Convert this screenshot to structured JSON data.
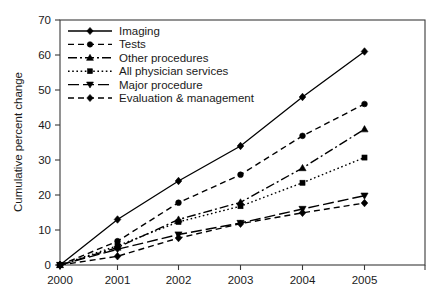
{
  "chart_data": {
    "type": "line",
    "title": "",
    "xlabel": "",
    "ylabel": "Cumulative percent change",
    "categories": [
      "2000",
      "2001",
      "2002",
      "2003",
      "2004",
      "2005"
    ],
    "x": [
      2000,
      2001,
      2002,
      2003,
      2004,
      2005
    ],
    "xlim": [
      2000,
      2005
    ],
    "ylim": [
      0,
      70
    ],
    "yticks": [
      0,
      10,
      20,
      30,
      40,
      50,
      60,
      70
    ],
    "xticks": [
      "2000",
      "2001",
      "2002",
      "2003",
      "2004",
      "2005"
    ],
    "grid": false,
    "legend_position": "top-left",
    "series": [
      {
        "name": "Imaging",
        "values": [
          0,
          13.0,
          24.0,
          34.0,
          48.0,
          61.0
        ],
        "marker": "diamond",
        "line_style": "solid",
        "color": "#000000"
      },
      {
        "name": "Tests",
        "values": [
          0,
          6.8,
          17.8,
          25.8,
          36.9,
          46.0
        ],
        "marker": "circle",
        "line_style": "dashed",
        "color": "#000000"
      },
      {
        "name": "Other procedures",
        "values": [
          0,
          5.0,
          13.0,
          17.9,
          27.7,
          38.8
        ],
        "marker": "triangle-up",
        "line_style": "dash-dot",
        "color": "#000000"
      },
      {
        "name": "All physician services",
        "values": [
          0,
          5.5,
          12.3,
          16.8,
          23.5,
          30.7
        ],
        "marker": "square",
        "line_style": "dotted",
        "color": "#000000"
      },
      {
        "name": "Major procedure",
        "values": [
          0,
          4.5,
          8.7,
          12.0,
          16.0,
          19.8
        ],
        "marker": "triangle-down",
        "line_style": "long-dash",
        "color": "#000000"
      },
      {
        "name": "Evaluation & management",
        "values": [
          0,
          2.5,
          7.7,
          11.8,
          14.9,
          17.7
        ],
        "marker": "diamond",
        "line_style": "dashed",
        "color": "#000000"
      }
    ]
  },
  "legend": {
    "items": [
      {
        "label": "Imaging"
      },
      {
        "label": "Tests"
      },
      {
        "label": "Other procedures"
      },
      {
        "label": "All physician services"
      },
      {
        "label": "Major procedure"
      },
      {
        "label": "Evaluation & management"
      }
    ]
  },
  "axes": {
    "y_title": "Cumulative percent change",
    "y_tick_labels": [
      "0",
      "10",
      "20",
      "30",
      "40",
      "50",
      "60",
      "70"
    ],
    "x_tick_labels": [
      "2000",
      "2001",
      "2002",
      "2003",
      "2004",
      "2005"
    ]
  }
}
